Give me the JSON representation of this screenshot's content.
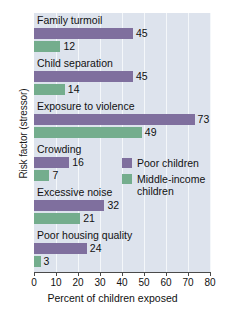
{
  "chart_data": {
    "type": "bar",
    "orientation": "horizontal",
    "title": "",
    "xlabel": "Percent of children exposed",
    "ylabel": "Risk factor (stressor)",
    "xlim": [
      0,
      80
    ],
    "xticks": [
      0,
      10,
      20,
      30,
      40,
      50,
      60,
      70,
      80
    ],
    "grid": true,
    "legend_position": "middle-right",
    "categories": [
      "Family turmoil",
      "Child separation",
      "Exposure to violence",
      "Crowding",
      "Excessive noise",
      "Poor housing quality"
    ],
    "series": [
      {
        "name": "Poor children",
        "color": "#7f6f9e",
        "values": [
          45,
          45,
          73,
          16,
          32,
          24
        ]
      },
      {
        "name": "Middle-income children",
        "color": "#74ad8d",
        "values": [
          12,
          14,
          49,
          7,
          21,
          3
        ]
      }
    ]
  },
  "legend": {
    "items": [
      {
        "label": "Poor children",
        "color": "#7f6f9e"
      },
      {
        "label": "Middle-income children",
        "color": "#74ad8d"
      }
    ]
  },
  "colors": {
    "plot_background": "#dde3ed",
    "gridline": "#f4f7fa",
    "axis": "#4a4a4a",
    "poor_children": "#7f6f9e",
    "middle_income_children": "#74ad8d",
    "page_background": "#ffffff"
  }
}
